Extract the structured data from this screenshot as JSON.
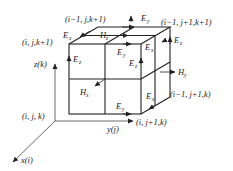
{
  "diagram": {
    "type": "Yee cell (FDTD) 3D grid diagram",
    "axes": {
      "x": "x(i)",
      "y": "y(j)",
      "z": "z(k)"
    },
    "node_labels": {
      "origin": "(i, j, k)",
      "top_front_left": "(i, j,k+1)",
      "top_back_left": "(i−1, j,k+1)",
      "top_back_right": "(i−1, j+1,k+1)",
      "bottom_front_right": "(i, j+1,k)",
      "bottom_back_right": "(i−1, j+1,k)"
    },
    "field_labels": {
      "ex_top": {
        "base": "E",
        "sub": "x"
      },
      "hz_top": {
        "base": "H",
        "sub": "z"
      },
      "ey_top_back": {
        "base": "E",
        "sub": "y"
      },
      "ey_top_front": {
        "base": "E",
        "sub": "y"
      },
      "ex_top_right": {
        "base": "E",
        "sub": "x"
      },
      "ez_back_right": {
        "base": "E",
        "sub": "z"
      },
      "ez_front_left": {
        "base": "E",
        "sub": "z"
      },
      "ez_front_mid": {
        "base": "E",
        "sub": "z"
      },
      "hy_right": {
        "base": "H",
        "sub": "y"
      },
      "hx_front": {
        "base": "H",
        "sub": "x"
      },
      "ey_bottom": {
        "base": "E",
        "sub": "y"
      },
      "ex_bottom_right": {
        "base": "E",
        "sub": "x"
      }
    },
    "colors": {
      "line": "#222222",
      "background": "#ffffff"
    }
  }
}
